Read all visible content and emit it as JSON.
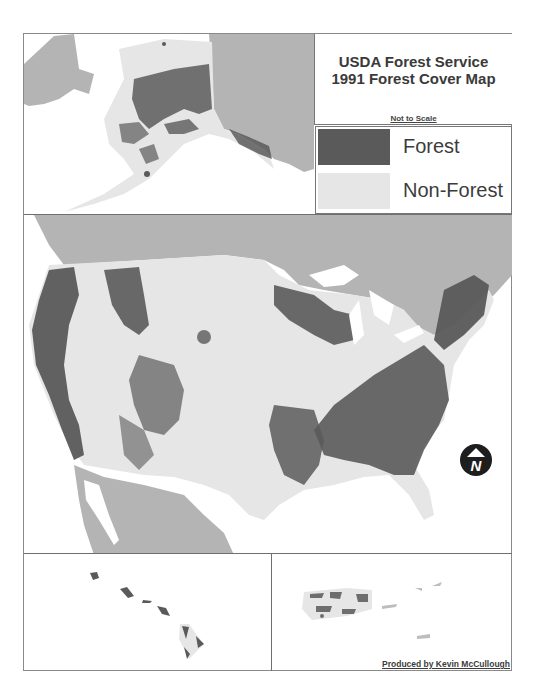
{
  "map": {
    "title_line1": "USDA Forest Service",
    "title_line2": "1991 Forest Cover Map",
    "scale_note": "Not to Scale",
    "credit": "Produced by Kevin McCullough",
    "north_arrow_label": "N",
    "icons": {
      "north_arrow": "north-arrow-icon"
    },
    "legend": [
      {
        "label": "Forest",
        "color": "#5a5a5a"
      },
      {
        "label": "Non-Forest",
        "color": "#e6e6e6"
      }
    ],
    "colors": {
      "forest": "#5a5a5a",
      "non_forest": "#e6e6e6",
      "other_land": "#b4b4b4",
      "water": "#ffffff",
      "border": "#777777"
    },
    "panels": [
      "Alaska",
      "Conterminous United States",
      "Hawaii",
      "Puerto Rico"
    ]
  }
}
